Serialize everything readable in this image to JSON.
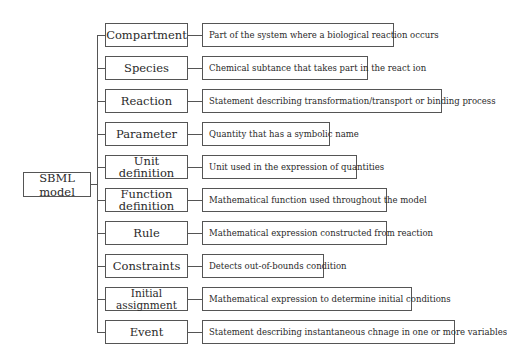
{
  "diagram": {
    "root": {
      "label": "SBML model"
    },
    "components": [
      {
        "name": "Compartment",
        "description": "Part of the system where a biological reaction occurs"
      },
      {
        "name": "Species",
        "description": "Chemical subtance that takes part in the react ion"
      },
      {
        "name": "Reaction",
        "description": "Statement describing transformation/transport or binding process"
      },
      {
        "name": "Parameter",
        "description": "Quantity that has a symbolic name"
      },
      {
        "name": "Unit definition",
        "description": "Unit used in the expression of quantities"
      },
      {
        "name": "Function definition",
        "description": "Mathematical function used throughout the model"
      },
      {
        "name": "Rule",
        "description": "Mathematical expression constructed from reaction"
      },
      {
        "name": "Constraints",
        "description": "Detects out-of-bounds condition"
      },
      {
        "name": "Initial assignment",
        "description": "Mathematical expression to determine initial conditions"
      },
      {
        "name": "Event",
        "description": "Statement describing instantaneous chnage in one or more variables"
      }
    ]
  },
  "colors": {
    "line": "#555555",
    "text": "#2a2a2a",
    "background": "#ffffff"
  }
}
